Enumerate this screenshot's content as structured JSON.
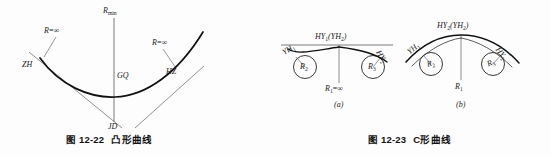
{
  "page": {
    "background_color": "#fdfdfd",
    "ink_color": "#1a1a1a",
    "width": 551,
    "height": 156
  },
  "figures": [
    {
      "id": "fig-12-22",
      "caption_number": "图 12-22",
      "caption_title": "凸形曲线",
      "description": "凸形曲线 (convex curve) — two transition spirals meeting at GQ with minimum radius",
      "labels": {
        "r_min": "R",
        "r_min_sub": "min",
        "r_inf_left": "R",
        "r_inf_left_eq": "=∞",
        "r_inf_right": "R",
        "r_inf_right_eq": "=∞",
        "zh": "ZH",
        "gq": "GQ",
        "hz": "HZ",
        "jd": "JD"
      }
    },
    {
      "id": "fig-12-23",
      "caption_number": "图 12-23",
      "caption_title": "C形曲线",
      "description": "C形曲线 (C-shaped curve) — two sub-diagrams (a) and (b)",
      "subfigures": [
        {
          "key": "a",
          "tag": "(a)",
          "apex_label_main": "HY",
          "apex_label_main_sub": "1",
          "apex_label_paren_open": "(",
          "apex_label_paren_text": "YH",
          "apex_label_paren_sub": "2",
          "apex_label_paren_close": ")",
          "left_tangent": "YH",
          "left_tangent_sub": "1",
          "right_tangent": "HY",
          "right_tangent_sub": "2",
          "left_radius": "R",
          "left_radius_sub": "2",
          "right_radius": "R",
          "right_radius_sub": "3",
          "center_radius": "R",
          "center_radius_sub": "1",
          "center_radius_eq": "=∞"
        },
        {
          "key": "b",
          "tag": "(b)",
          "apex_label_main": "HY",
          "apex_label_main_sub": "2",
          "apex_label_paren_open": "(",
          "apex_label_paren_text": "YH",
          "apex_label_paren_sub": "2",
          "apex_label_paren_close": ")",
          "left_tangent": "YH",
          "left_tangent_sub": "1",
          "right_tangent": "HY",
          "right_tangent_sub": "2",
          "left_radius": "R",
          "left_radius_sub": "2",
          "right_radius": "R",
          "right_radius_sub": "3",
          "center_radius": "R",
          "center_radius_sub": "1",
          "center_radius_eq": ""
        }
      ]
    }
  ]
}
